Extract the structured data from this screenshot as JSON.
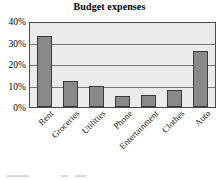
{
  "chart_data": {
    "type": "bar",
    "title": "Budget expenses",
    "xlabel": "",
    "ylabel": "",
    "categories": [
      "Rent",
      "Groceries",
      "Utilities",
      "Phone",
      "Entertainment",
      "Clothes",
      "Auto"
    ],
    "values": [
      33,
      12,
      10,
      5,
      5.5,
      8,
      26
    ],
    "ylim": [
      0,
      40
    ],
    "ytick_labels": [
      "40%",
      "30%",
      "20%",
      "10%",
      "0%"
    ],
    "ytick_values": [
      40,
      30,
      20,
      10,
      0
    ],
    "grid": true,
    "legend": false,
    "legend_position": "none",
    "units": "percent",
    "colors": {
      "bar_fill": "#898989",
      "bar_edge": "#3a3a3a",
      "plot_background": "#ebebeb",
      "gridline": "#777777",
      "axis_border": "#4a4a4a",
      "text": "#000000",
      "figure_background": "#ffffff"
    }
  }
}
